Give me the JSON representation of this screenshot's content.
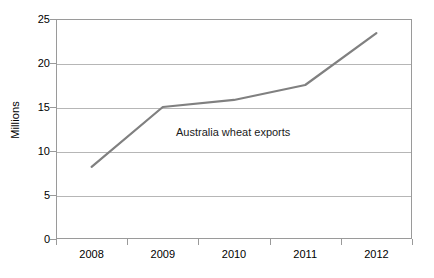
{
  "chart_data": {
    "type": "line",
    "title": "",
    "xlabel": "",
    "ylabel": "Millions",
    "categories": [
      "2008",
      "2009",
      "2010",
      "2011",
      "2012"
    ],
    "x": [
      2008,
      2009,
      2010,
      2011,
      2012
    ],
    "values": [
      8.2,
      15.0,
      15.8,
      17.5,
      23.4
    ],
    "series": [
      {
        "name": "Australia wheat exports",
        "values": [
          8.2,
          15.0,
          15.8,
          17.5,
          23.4
        ],
        "color": "#808080"
      }
    ],
    "ylim": [
      0,
      25
    ],
    "yticks": [
      0,
      5,
      10,
      15,
      20,
      25
    ],
    "ytick_labels": [
      "0",
      "5",
      "10",
      "15",
      "20",
      "25"
    ],
    "xtick_labels": [
      "2008",
      "2009",
      "2010",
      "2011",
      "2012"
    ],
    "grid": "horizontal",
    "legend": "none",
    "annotations": [
      {
        "text": "Australia wheat exports",
        "x_value": 2010,
        "y_value": 12.0
      }
    ]
  },
  "axes": {
    "y_title": "Millions"
  },
  "colors": {
    "series_line": "#808080",
    "gridline": "#b6b6b6",
    "frame": "#9a9a9a",
    "text": "#000000",
    "background": "#ffffff"
  }
}
